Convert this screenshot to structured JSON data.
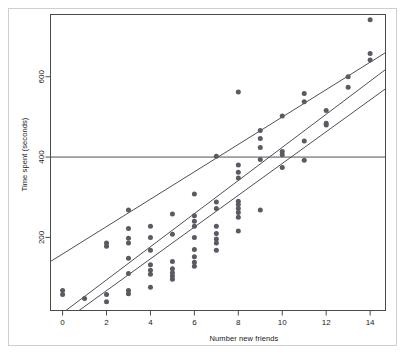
{
  "chart_data": {
    "type": "scatter",
    "title": "",
    "xlabel": "Number new friends",
    "ylabel": "Time spent (seconds)",
    "xticks": [
      0,
      2,
      4,
      6,
      8,
      10,
      12,
      14
    ],
    "yticks": [
      200,
      400,
      600
    ],
    "xlim": [
      -0.55,
      14.7
    ],
    "ylim": [
      18,
      755
    ],
    "grid": false,
    "legend": null,
    "point_color": "#5a5a63",
    "line_color": "#3c3c42",
    "frame_color": "#4a4a4a",
    "points": [
      {
        "x": 0,
        "y": 68
      },
      {
        "x": 0,
        "y": 58
      },
      {
        "x": 1,
        "y": 48
      },
      {
        "x": 2,
        "y": 186
      },
      {
        "x": 2,
        "y": 178
      },
      {
        "x": 2,
        "y": 58
      },
      {
        "x": 2,
        "y": 40
      },
      {
        "x": 3,
        "y": 268
      },
      {
        "x": 3,
        "y": 222
      },
      {
        "x": 3,
        "y": 198
      },
      {
        "x": 3,
        "y": 186
      },
      {
        "x": 3,
        "y": 148
      },
      {
        "x": 3,
        "y": 110
      },
      {
        "x": 3,
        "y": 68
      },
      {
        "x": 3,
        "y": 60
      },
      {
        "x": 4,
        "y": 228
      },
      {
        "x": 4,
        "y": 200
      },
      {
        "x": 4,
        "y": 168
      },
      {
        "x": 4,
        "y": 132
      },
      {
        "x": 4,
        "y": 118
      },
      {
        "x": 4,
        "y": 108
      },
      {
        "x": 4,
        "y": 76
      },
      {
        "x": 5,
        "y": 258
      },
      {
        "x": 5,
        "y": 208
      },
      {
        "x": 5,
        "y": 140
      },
      {
        "x": 5,
        "y": 122
      },
      {
        "x": 5,
        "y": 112
      },
      {
        "x": 5,
        "y": 104
      },
      {
        "x": 5,
        "y": 96
      },
      {
        "x": 6,
        "y": 308
      },
      {
        "x": 6,
        "y": 254
      },
      {
        "x": 6,
        "y": 240
      },
      {
        "x": 6,
        "y": 228
      },
      {
        "x": 6,
        "y": 200
      },
      {
        "x": 6,
        "y": 170
      },
      {
        "x": 6,
        "y": 152
      },
      {
        "x": 6,
        "y": 138
      },
      {
        "x": 6,
        "y": 128
      },
      {
        "x": 7,
        "y": 402
      },
      {
        "x": 7,
        "y": 288
      },
      {
        "x": 7,
        "y": 272
      },
      {
        "x": 7,
        "y": 228
      },
      {
        "x": 7,
        "y": 210
      },
      {
        "x": 7,
        "y": 196
      },
      {
        "x": 7,
        "y": 186
      },
      {
        "x": 7,
        "y": 168
      },
      {
        "x": 8,
        "y": 562
      },
      {
        "x": 8,
        "y": 380
      },
      {
        "x": 8,
        "y": 362
      },
      {
        "x": 8,
        "y": 348
      },
      {
        "x": 8,
        "y": 290
      },
      {
        "x": 8,
        "y": 282
      },
      {
        "x": 8,
        "y": 272
      },
      {
        "x": 8,
        "y": 262
      },
      {
        "x": 8,
        "y": 250
      },
      {
        "x": 8,
        "y": 216
      },
      {
        "x": 9,
        "y": 466
      },
      {
        "x": 9,
        "y": 446
      },
      {
        "x": 9,
        "y": 424
      },
      {
        "x": 9,
        "y": 394
      },
      {
        "x": 9,
        "y": 268
      },
      {
        "x": 10,
        "y": 502
      },
      {
        "x": 10,
        "y": 414
      },
      {
        "x": 10,
        "y": 406
      },
      {
        "x": 10,
        "y": 374
      },
      {
        "x": 11,
        "y": 558
      },
      {
        "x": 11,
        "y": 538
      },
      {
        "x": 11,
        "y": 440
      },
      {
        "x": 11,
        "y": 392
      },
      {
        "x": 12,
        "y": 516
      },
      {
        "x": 12,
        "y": 484
      },
      {
        "x": 12,
        "y": 480
      },
      {
        "x": 13,
        "y": 600
      },
      {
        "x": 13,
        "y": 574
      },
      {
        "x": 14,
        "y": 742
      },
      {
        "x": 14,
        "y": 658
      },
      {
        "x": 14,
        "y": 642
      }
    ],
    "lines": [
      {
        "name": "upper-fit-line",
        "x0": -0.55,
        "y0": 140,
        "x1": 14.7,
        "y1": 660
      },
      {
        "name": "middle-fit-line",
        "x0": 0.15,
        "y0": 18,
        "x1": 14.7,
        "y1": 618
      },
      {
        "name": "lower-fit-line",
        "x0": 0.75,
        "y0": 18,
        "x1": 14.7,
        "y1": 570
      },
      {
        "name": "reference-line-400",
        "x0": -0.55,
        "y0": 400,
        "x1": 14.7,
        "y1": 400
      }
    ]
  }
}
